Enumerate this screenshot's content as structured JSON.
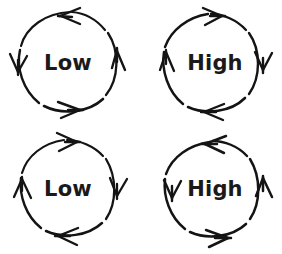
{
  "figure": {
    "title": "",
    "background_color": "#ffffff",
    "ink_color": "#141414",
    "style": "hand-drawn sketch",
    "grid": {
      "rows": 2,
      "columns": 2
    },
    "cycles": [
      {
        "id": "cycle-top-left",
        "label": "Low",
        "direction": "counter-clockwise",
        "position": "top-left",
        "center": {
          "x": 68,
          "y": 62
        },
        "radius": 50,
        "arrowheads": [
          {
            "at": "top",
            "points": "left"
          },
          {
            "at": "right",
            "points": "up"
          },
          {
            "at": "bottom",
            "points": "right"
          },
          {
            "at": "left",
            "points": "down"
          }
        ]
      },
      {
        "id": "cycle-top-right",
        "label": "High",
        "direction": "clockwise",
        "position": "top-right",
        "center": {
          "x": 214,
          "y": 62
        },
        "radius": 50,
        "arrowheads": [
          {
            "at": "top",
            "points": "right"
          },
          {
            "at": "right",
            "points": "down"
          },
          {
            "at": "bottom",
            "points": "left"
          },
          {
            "at": "left",
            "points": "up"
          }
        ]
      },
      {
        "id": "cycle-bottom-left",
        "label": "Low",
        "direction": "clockwise",
        "position": "bottom-left",
        "center": {
          "x": 68,
          "y": 188
        },
        "radius": 50,
        "arrowheads": [
          {
            "at": "top",
            "points": "right"
          },
          {
            "at": "right",
            "points": "down"
          },
          {
            "at": "bottom",
            "points": "left"
          },
          {
            "at": "left",
            "points": "up"
          }
        ]
      },
      {
        "id": "cycle-bottom-right",
        "label": "High",
        "direction": "counter-clockwise",
        "position": "bottom-right",
        "center": {
          "x": 214,
          "y": 188
        },
        "radius": 50,
        "arrowheads": [
          {
            "at": "top",
            "points": "left"
          },
          {
            "at": "right",
            "points": "up"
          },
          {
            "at": "bottom",
            "points": "right"
          },
          {
            "at": "left",
            "points": "down"
          }
        ]
      }
    ],
    "cropped_caption": {
      "visible": true,
      "note": "partially cropped text row at bottom edge",
      "fragments": [
        "",
        ""
      ]
    }
  }
}
